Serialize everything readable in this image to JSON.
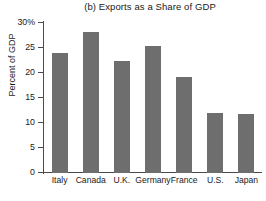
{
  "chart_data": {
    "type": "bar",
    "title": "(b) Exports as a Share of GDP",
    "xlabel": "",
    "ylabel": "Percent of GDP",
    "categories": [
      "Italy",
      "Canada",
      "U.K.",
      "Germany",
      "France",
      "U.S.",
      "Japan"
    ],
    "values": [
      24.0,
      28.2,
      22.4,
      25.5,
      19.2,
      12.0,
      11.9
    ],
    "ylim": [
      0,
      30
    ],
    "yticks": [
      0,
      5,
      10,
      15,
      20,
      25,
      30
    ],
    "ytick_labels": [
      "0",
      "5",
      "10",
      "15",
      "20",
      "25",
      "30%"
    ],
    "grid": false,
    "legend": null,
    "bar_color": "#6e6e6e",
    "axis_color": "#4a4a4a",
    "text_color": "#1a1a1a",
    "background": "#ffffff"
  }
}
